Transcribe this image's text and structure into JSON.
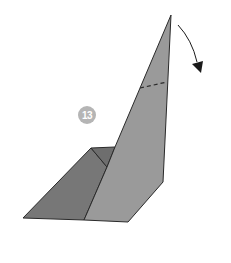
{
  "diagram": {
    "type": "origami-fold-step",
    "step_number": "13",
    "colors": {
      "back_flap_dark": "#777777",
      "back_flap_inner": "#6e6e6e",
      "front_panel": "#9a9a9a",
      "outline": "#2a2a2a",
      "badge": "#b5b5b5",
      "arrow": "#1a1a1a"
    },
    "instruction": {
      "fold_line": "dashed",
      "arrow_direction": "valley-fold-down-right"
    }
  }
}
